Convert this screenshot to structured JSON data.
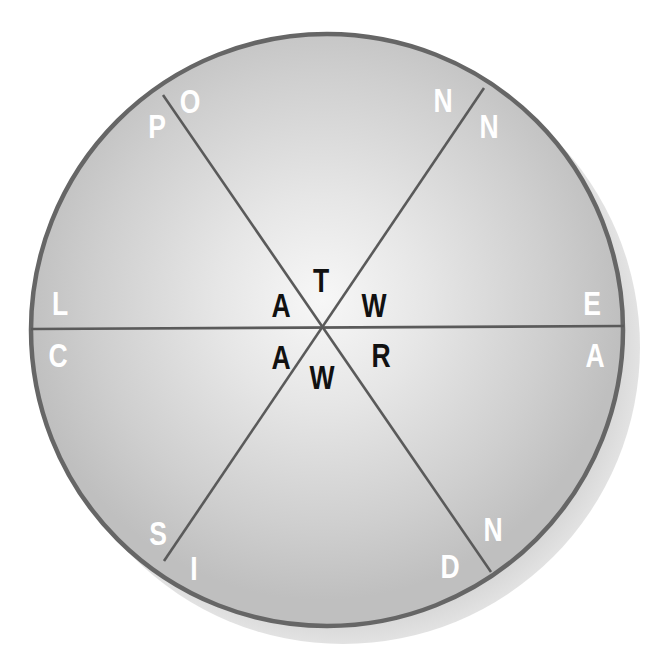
{
  "puzzle": {
    "type": "word-wheel",
    "segments": 6,
    "center_letters": [
      {
        "id": "c1",
        "char": "T",
        "x": 321,
        "y": 280
      },
      {
        "id": "c2",
        "char": "A",
        "x": 281,
        "y": 305
      },
      {
        "id": "c3",
        "char": "W",
        "x": 374,
        "y": 305
      },
      {
        "id": "c4",
        "char": "A",
        "x": 281,
        "y": 357
      },
      {
        "id": "c5",
        "char": "R",
        "x": 381,
        "y": 355
      },
      {
        "id": "c6",
        "char": "W",
        "x": 322,
        "y": 377
      }
    ],
    "outer_letters": [
      {
        "id": "o1",
        "char": "P",
        "x": 157,
        "y": 126
      },
      {
        "id": "o2",
        "char": "O",
        "x": 190,
        "y": 101
      },
      {
        "id": "o3",
        "char": "N",
        "x": 443,
        "y": 100
      },
      {
        "id": "o4",
        "char": "N",
        "x": 489,
        "y": 126
      },
      {
        "id": "o5",
        "char": "L",
        "x": 60,
        "y": 303
      },
      {
        "id": "o6",
        "char": "C",
        "x": 58,
        "y": 355
      },
      {
        "id": "o7",
        "char": "E",
        "x": 592,
        "y": 303
      },
      {
        "id": "o8",
        "char": "A",
        "x": 595,
        "y": 355
      },
      {
        "id": "o9",
        "char": "S",
        "x": 158,
        "y": 533
      },
      {
        "id": "o10",
        "char": "I",
        "x": 194,
        "y": 568
      },
      {
        "id": "o11",
        "char": "N",
        "x": 493,
        "y": 529
      },
      {
        "id": "o12",
        "char": "D",
        "x": 450,
        "y": 566
      }
    ]
  },
  "colors": {
    "background": "#ffffff",
    "shadow": "#dcdcdc",
    "rim": "#666666",
    "divider": "#5a5a5a",
    "fill_center": "#f6f6f6",
    "fill_edge": "#c2c2c2",
    "outer_letter": "#ffffff",
    "inner_letter": "#111111"
  }
}
